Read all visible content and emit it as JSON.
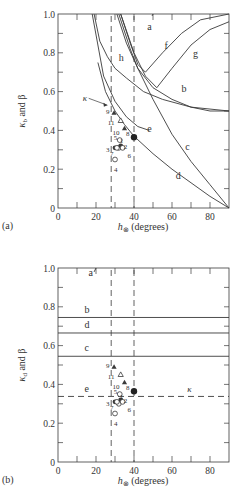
{
  "chart_data": [
    {
      "panel_label": "(a)",
      "type": "line",
      "xlabel": "h_⊗ (degrees)",
      "ylabel": "κ_b and β",
      "xlim": [
        0,
        90
      ],
      "ylim": [
        0,
        1.0
      ],
      "xticks": [
        "0",
        "20",
        "40",
        "60",
        "80"
      ],
      "yticks": [
        "0",
        "0.2",
        "0.4",
        "0.6",
        "0.8",
        "1.0"
      ],
      "vertical_dashed_lines_x": [
        28,
        40
      ],
      "curves": [
        {
          "name": "a",
          "x": [
            49.5,
            50
          ],
          "y": [
            0.99,
            1.0
          ]
        },
        {
          "name": "b",
          "x": [
            32,
            38,
            42,
            50,
            60,
            70,
            80,
            90
          ],
          "y": [
            1.0,
            0.82,
            0.72,
            0.62,
            0.56,
            0.52,
            0.5,
            0.5
          ]
        },
        {
          "name": "c",
          "x": [
            31,
            36,
            42,
            50,
            60,
            70,
            80,
            90
          ],
          "y": [
            1.0,
            0.85,
            0.72,
            0.56,
            0.38,
            0.24,
            0.12,
            0.0
          ]
        },
        {
          "name": "d",
          "x": [
            21,
            25,
            30,
            35,
            40,
            50,
            60,
            70,
            80,
            90
          ],
          "y": [
            0.75,
            0.6,
            0.5,
            0.43,
            0.37,
            0.28,
            0.2,
            0.13,
            0.06,
            0.0
          ]
        },
        {
          "name": "e",
          "x": [
            18,
            24,
            30,
            36,
            42,
            48
          ],
          "y": [
            1.0,
            0.68,
            0.55,
            0.47,
            0.42,
            0.4
          ]
        },
        {
          "name": "f",
          "x": [
            33,
            38,
            42,
            46,
            55,
            65,
            75,
            90
          ],
          "y": [
            1.0,
            0.85,
            0.74,
            0.7,
            0.8,
            0.9,
            0.97,
            1.0
          ]
        },
        {
          "name": "g",
          "x": [
            33,
            40,
            46,
            52,
            60,
            70,
            80,
            90
          ],
          "y": [
            1.0,
            0.8,
            0.68,
            0.62,
            0.72,
            0.84,
            0.92,
            0.96
          ]
        },
        {
          "name": "h",
          "x": [
            19,
            22,
            26,
            30,
            36,
            45,
            55,
            70,
            90
          ],
          "y": [
            1.0,
            0.86,
            0.78,
            0.72,
            0.67,
            0.6,
            0.56,
            0.52,
            0.5
          ]
        }
      ],
      "points": [
        {
          "label": "1",
          "x": 32,
          "y": 0.31,
          "marker": "open-circle"
        },
        {
          "label": "2",
          "x": 33,
          "y": 0.32,
          "marker": "filled-circle"
        },
        {
          "label": "3",
          "x": 30,
          "y": 0.31,
          "marker": "filled-circle"
        },
        {
          "label": "4",
          "x": 30,
          "y": 0.25,
          "marker": "open-circle"
        },
        {
          "label": "5",
          "x": 32.5,
          "y": 0.35,
          "marker": "open-circle"
        },
        {
          "label": "6",
          "x": 34,
          "y": 0.31,
          "marker": "open-circle"
        },
        {
          "label": "7",
          "x": 31,
          "y": 0.31,
          "marker": "open-circle"
        },
        {
          "label": "8",
          "x": 40,
          "y": 0.365,
          "marker": "filled-circle-large"
        },
        {
          "label": "9",
          "x": 29.5,
          "y": 0.49,
          "marker": "filled-triangle"
        },
        {
          "label": "10",
          "x": 35,
          "y": 0.41,
          "marker": "filled-triangle"
        },
        {
          "label": "11",
          "x": 33,
          "y": 0.45,
          "marker": "open-triangle"
        }
      ],
      "annotations": [
        {
          "text": "κ",
          "x": 13,
          "y": 0.55,
          "arrow_to": [
            26,
            0.53
          ]
        }
      ]
    },
    {
      "panel_label": "(b)",
      "type": "line",
      "xlabel": "h_⊗ (degrees)",
      "ylabel": "κ_d and β",
      "xlim": [
        0,
        90
      ],
      "ylim": [
        0,
        1.0
      ],
      "xticks": [
        "0",
        "20",
        "40",
        "60",
        "80"
      ],
      "yticks": [
        "0",
        "0.2",
        "0.4",
        "0.6",
        "0.8",
        "1.0"
      ],
      "vertical_dashed_lines_x": [
        28,
        40
      ],
      "curves": [
        {
          "name": "a",
          "x": [
            19,
            20
          ],
          "y": [
            0.98,
            1.0
          ]
        },
        {
          "name": "b",
          "x": [
            0,
            90
          ],
          "y": [
            0.745,
            0.745
          ]
        },
        {
          "name": "c",
          "x": [
            0,
            90
          ],
          "y": [
            0.545,
            0.545
          ]
        },
        {
          "name": "d",
          "x": [
            0,
            90
          ],
          "y": [
            0.665,
            0.665
          ]
        },
        {
          "name": "e",
          "x": [
            0,
            90
          ],
          "y": [
            0.338,
            0.338
          ],
          "style": "dashed"
        }
      ],
      "points": [
        {
          "label": "1",
          "x": 32,
          "y": 0.3,
          "marker": "open-circle"
        },
        {
          "label": "2",
          "x": 33,
          "y": 0.32,
          "marker": "filled-circle"
        },
        {
          "label": "3",
          "x": 30,
          "y": 0.31,
          "marker": "filled-circle"
        },
        {
          "label": "4",
          "x": 30,
          "y": 0.25,
          "marker": "open-circle"
        },
        {
          "label": "5",
          "x": 32.5,
          "y": 0.35,
          "marker": "open-circle"
        },
        {
          "label": "6",
          "x": 34,
          "y": 0.31,
          "marker": "open-circle"
        },
        {
          "label": "7",
          "x": 31,
          "y": 0.31,
          "marker": "open-circle"
        },
        {
          "label": "8",
          "x": 40,
          "y": 0.365,
          "marker": "filled-circle-large"
        },
        {
          "label": "9",
          "x": 29.5,
          "y": 0.49,
          "marker": "filled-triangle"
        },
        {
          "label": "10",
          "x": 35,
          "y": 0.41,
          "marker": "filled-triangle"
        },
        {
          "label": "11",
          "x": 33,
          "y": 0.45,
          "marker": "open-triangle"
        }
      ],
      "annotations": [
        {
          "text": "κ",
          "x": 68,
          "y": 0.36
        }
      ]
    }
  ],
  "figure": {
    "panel_a_label": "(a)",
    "panel_b_label": "(b)",
    "panel_a_ylabel": "κ",
    "panel_a_ylabel_sub": "b",
    "panel_a_ylabel_rest": " and β",
    "panel_b_ylabel": "κ",
    "panel_b_ylabel_sub": "d",
    "panel_b_ylabel_rest": " and β",
    "xlabel_h": "h",
    "xlabel_sub": "⊗",
    "xlabel_rest": " (degrees)"
  }
}
